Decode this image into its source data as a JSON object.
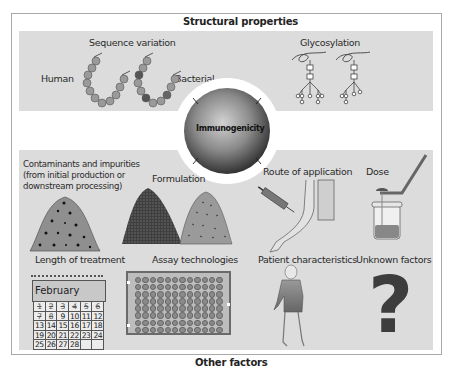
{
  "figure": {
    "top_header": "Structural properties",
    "bottom_header": "Other factors",
    "center": {
      "label": "Immunogenicity"
    },
    "structural": {
      "sequence_variation": {
        "title": "Sequence variation",
        "left_label": "Human",
        "right_label": "Bacterial",
        "human_chain": [
          "A",
          "L",
          "C",
          "N",
          "A",
          "T",
          "E",
          "K",
          "K",
          "T"
        ],
        "bacterial_chain": [
          "A",
          "S",
          "N",
          "A",
          "T",
          "E",
          "K",
          "K",
          "F",
          "K"
        ]
      },
      "glycosylation": {
        "title": "Glycosylation"
      }
    },
    "other_factors": [
      {
        "id": "contaminants",
        "title": "Contaminants and impurities (from initial production or downstream processing)"
      },
      {
        "id": "formulation",
        "title": "Formulation"
      },
      {
        "id": "route",
        "title": "Route of application"
      },
      {
        "id": "dose",
        "title": "Dose"
      },
      {
        "id": "length",
        "title": "Length of treatment"
      },
      {
        "id": "assay",
        "title": "Assay technologies"
      },
      {
        "id": "patient",
        "title": "Patient characteristics"
      },
      {
        "id": "unknown",
        "title": "Unknown factors",
        "glyph": "?"
      }
    ],
    "calendar": {
      "month": "February",
      "weeks": [
        [
          "1",
          "2",
          "3",
          "4",
          "5",
          "6"
        ],
        [
          "7",
          "8",
          "9",
          "10",
          "11",
          "12"
        ],
        [
          "13",
          "14",
          "15",
          "16",
          "17",
          "18"
        ],
        [
          "19",
          "20",
          "21",
          "22",
          "23",
          "24"
        ],
        [
          "25",
          "26",
          "27",
          "28",
          "",
          ""
        ]
      ],
      "crossed_out_through": 8
    },
    "assay_plate": {
      "rows": 8,
      "columns": 12
    },
    "colors": {
      "panel_bg": "#dcdcdc",
      "frame_border": "#a9a9a9",
      "sphere_dark": "#3a3a3a",
      "sphere_light": "#c8c8c8",
      "question_mark": "#3d3d3d"
    }
  }
}
